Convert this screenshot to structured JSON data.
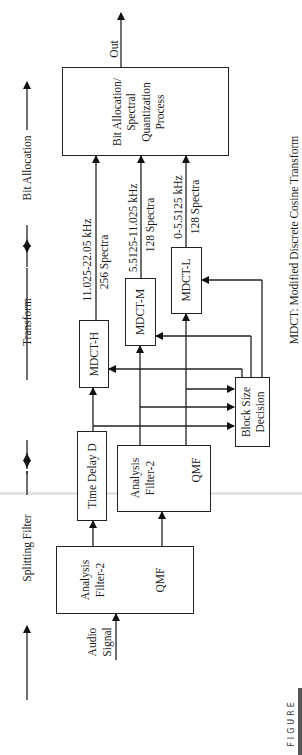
{
  "stages": {
    "splitting": "Splitting Filter",
    "transform": "Transform",
    "bit_allocation": "Bit Allocation"
  },
  "blocks": {
    "qmf1": {
      "line1": "Analysis",
      "line2": "Filter-2",
      "line3": "QMF"
    },
    "time_delay": "Time Delay D",
    "qmf2": {
      "line1": "Analysis",
      "line2": "Filter-2",
      "line3": "QMF"
    },
    "mdct_h": "MDCT-H",
    "mdct_m": "MDCT-M",
    "mdct_l": "MDCT-L",
    "block_size": {
      "line1": "Block Size",
      "line2": "Decision"
    },
    "bit_alloc": {
      "line1": "Bit Allocation/",
      "line2": "Spectral",
      "line3": "Quantization",
      "line4": "Process"
    }
  },
  "signals": {
    "input": {
      "line1": "Audio",
      "line2": "Signal"
    },
    "output": "Out",
    "high": {
      "band": "11.025-22.05 kHz",
      "spectra": "256 Spectra"
    },
    "mid": {
      "band": "5.5125-11.025 kHz",
      "spectra": "128 Spectra"
    },
    "low": {
      "band": "0-5.5125 kHz",
      "spectra": "128 Spectra"
    }
  },
  "footnote": "MDCT: Modified Discrete Cosine Transform",
  "figure_label": "FIGURE"
}
